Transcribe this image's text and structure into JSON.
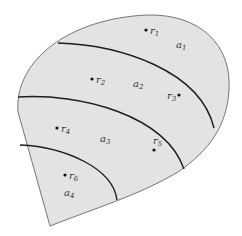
{
  "diagram": {
    "colors": {
      "fill": "#e3e3e3",
      "outline": "#666666",
      "boundary": "#1e1e1e",
      "text": "#333333"
    },
    "regions": [
      {
        "id": "a1",
        "label": "a",
        "sub": "1"
      },
      {
        "id": "a2",
        "label": "a",
        "sub": "2"
      },
      {
        "id": "a3",
        "label": "a",
        "sub": "3"
      },
      {
        "id": "a4",
        "label": "a",
        "sub": "4"
      }
    ],
    "points": [
      {
        "id": "r1",
        "label": "r",
        "sub": "1"
      },
      {
        "id": "r2",
        "label": "r",
        "sub": "2"
      },
      {
        "id": "r3",
        "label": "r",
        "sub": "3"
      },
      {
        "id": "r4",
        "label": "r",
        "sub": "4"
      },
      {
        "id": "r5",
        "label": "r",
        "sub": "5"
      },
      {
        "id": "r6",
        "label": "r",
        "sub": "6"
      }
    ]
  }
}
